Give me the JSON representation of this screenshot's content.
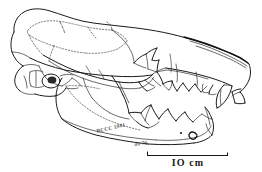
{
  "figure": {
    "technique": "pen-and-ink line drawing",
    "background_color": "#ffffff",
    "ink_color": "#1a1a1a"
  },
  "scale_bar": {
    "label": "IO  cm",
    "value": 10,
    "unit": "cm",
    "orientation": "horizontal",
    "position": "bottom-right"
  },
  "annotations": {
    "specimen_label": "BCCC 1981",
    "collector_label": "do 79"
  },
  "anatomy": {
    "regions": [
      {
        "name": "braincase"
      },
      {
        "name": "sagittal-crest"
      },
      {
        "name": "occipital-region"
      },
      {
        "name": "auditory-bulla"
      },
      {
        "name": "occipital-condyle"
      },
      {
        "name": "zygomatic-arch"
      },
      {
        "name": "orbit"
      },
      {
        "name": "rostrum"
      },
      {
        "name": "nasal-bone"
      },
      {
        "name": "premaxilla"
      },
      {
        "name": "upper-canine"
      },
      {
        "name": "upper-premolars"
      },
      {
        "name": "upper-carnassial"
      },
      {
        "name": "mandible"
      },
      {
        "name": "coronoid-process"
      },
      {
        "name": "mandibular-condyle"
      },
      {
        "name": "angular-process"
      },
      {
        "name": "lower-canine"
      },
      {
        "name": "lower-premolars"
      },
      {
        "name": "lower-carnassial"
      },
      {
        "name": "mental-foramina"
      }
    ]
  }
}
